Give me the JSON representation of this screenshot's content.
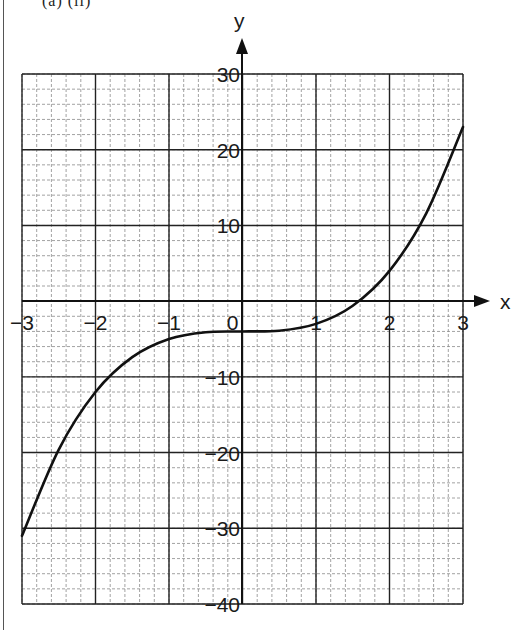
{
  "header": {
    "text": "(a)  (ii)"
  },
  "chart_data": {
    "type": "line",
    "title": "",
    "xlabel": "x",
    "ylabel": "y",
    "xlim": [
      -3,
      3
    ],
    "ylim": [
      -40,
      30
    ],
    "grid": true,
    "grid_major": {
      "x_step": 1,
      "y_step": 10
    },
    "grid_minor": {
      "x_step": 0.2,
      "y_step": 2
    },
    "x_ticks": [
      "−3",
      "−2",
      "−1",
      "0",
      "1",
      "2",
      "3"
    ],
    "y_ticks": [
      "30",
      "20",
      "10",
      "−10",
      "−20",
      "−30",
      "−40"
    ],
    "series": [
      {
        "name": "y = x³ − 4",
        "x": [
          -3,
          -2.5,
          -2,
          -1.5,
          -1,
          -0.5,
          0,
          0.5,
          1,
          1.5,
          2,
          2.5,
          3
        ],
        "values": [
          -31,
          -19.6,
          -12,
          -7.4,
          -5,
          -4.1,
          -4,
          -3.9,
          -3,
          -0.6,
          4,
          11.6,
          23
        ]
      }
    ],
    "legend": "none",
    "colors": {
      "curve": "#111111",
      "major_grid": "#222222",
      "minor_grid": "#8a8a8a"
    }
  }
}
